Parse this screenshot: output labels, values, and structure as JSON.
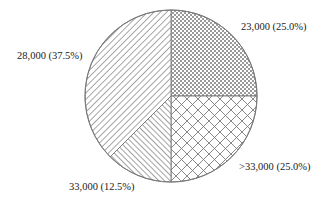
{
  "chart_data": {
    "type": "pie",
    "title": "",
    "start_angle_deg": 0,
    "direction": "clockwise",
    "slices": [
      {
        "label": "23,000 (25.0%)",
        "category": "23,000",
        "percent": 25.0,
        "pattern": "checker"
      },
      {
        "label": ">33,000 (25.0%)",
        "category": ">33,000",
        "percent": 25.0,
        "pattern": "diamond-crosshatch"
      },
      {
        "label": "33,000 (12.5%)",
        "category": "33,000",
        "percent": 12.5,
        "pattern": "dense-diagonal-left"
      },
      {
        "label": "28,000 (37.5%)",
        "category": "28,000",
        "percent": 37.5,
        "pattern": "diagonal-right"
      }
    ],
    "legend": "none (direct labels)",
    "colors": {
      "stroke": "#777777",
      "pattern": "#8a8a8a",
      "background": "#ffffff"
    }
  }
}
